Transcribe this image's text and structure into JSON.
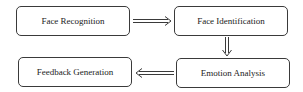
{
  "diagram": {
    "type": "flowchart",
    "nodes": [
      {
        "id": "face_recognition",
        "label": "Face Recognition"
      },
      {
        "id": "face_identification",
        "label": "Face Identification"
      },
      {
        "id": "emotion_analysis",
        "label": "Emotion Analysis"
      },
      {
        "id": "feedback_generation",
        "label": "Feedback Generation"
      }
    ],
    "edges": [
      {
        "from": "face_recognition",
        "to": "face_identification",
        "style": "double-arrow-right"
      },
      {
        "from": "face_identification",
        "to": "emotion_analysis",
        "style": "double-arrow-down"
      },
      {
        "from": "emotion_analysis",
        "to": "feedback_generation",
        "style": "double-arrow-left"
      }
    ],
    "colors": {
      "border": "#3a3a3a",
      "text": "#222222",
      "background": "#ffffff"
    }
  }
}
